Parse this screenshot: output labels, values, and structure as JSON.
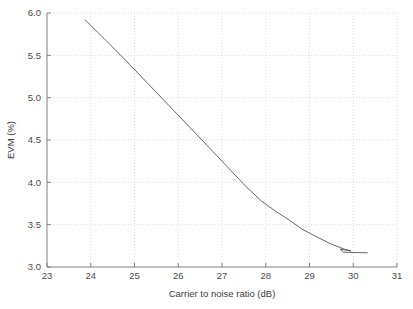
{
  "chart_data": {
    "type": "line",
    "title": "",
    "xlabel": "Carrier to noise ratio (dB)",
    "ylabel": "EVM (%)",
    "xlim": [
      23,
      31
    ],
    "ylim": [
      3.0,
      6.0
    ],
    "xticks": [
      23,
      24,
      25,
      26,
      27,
      28,
      29,
      30,
      31
    ],
    "xtick_labels": [
      "23",
      "24",
      "25",
      "26",
      "27",
      "28",
      "29",
      "30",
      "31"
    ],
    "yticks": [
      3.0,
      3.5,
      4.0,
      4.5,
      5.0,
      5.5,
      6.0
    ],
    "ytick_labels": [
      "3.0",
      "3.5",
      "4.0",
      "4.5",
      "5.0",
      "5.5",
      "6.0"
    ],
    "grid": true,
    "grid_style": "dotted",
    "grid_color": "#cfcfcf",
    "legend": null,
    "line_color": "#555555",
    "background_color": "#ffffff",
    "series": [
      {
        "name": "EVM",
        "x": [
          23.87,
          24.3,
          24.8,
          25.3,
          25.8,
          26.3,
          26.8,
          27.2,
          27.55,
          27.9,
          28.25,
          28.55,
          28.82,
          29.15,
          29.5,
          29.8,
          29.95,
          29.7,
          29.78,
          30.1,
          30.32
        ],
        "y": [
          5.92,
          5.7,
          5.44,
          5.17,
          4.9,
          4.63,
          4.36,
          4.14,
          3.95,
          3.78,
          3.65,
          3.55,
          3.45,
          3.36,
          3.27,
          3.21,
          3.19,
          3.21,
          3.175,
          3.17,
          3.168
        ]
      }
    ]
  },
  "axes": {
    "x_axis_label": "Carrier to noise ratio (dB)",
    "y_axis_label": "EVM (%)"
  }
}
